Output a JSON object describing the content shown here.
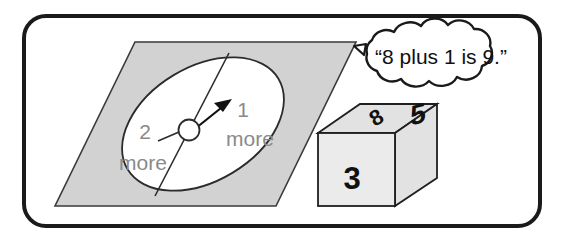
{
  "figure": {
    "frame": {
      "border_color": "#1a1a1a",
      "background": "#ffffff"
    },
    "spinner": {
      "name": "spinner",
      "board_fill": "#d2d2d2",
      "dial_fill": "#ffffff",
      "outline_color": "#2b2b2b",
      "hub_fill": "#ffffff",
      "sectors": [
        {
          "id": "left",
          "line1": "2",
          "line2": "more"
        },
        {
          "id": "right",
          "line1": "1",
          "line2": "more"
        }
      ],
      "pointer": {
        "name": "spinner-arrow",
        "points_to": "1 more",
        "color": "#111111"
      }
    },
    "number_cube": {
      "name": "number-cube",
      "face_fill_front": "#ebebeb",
      "face_fill_top": "#e2e2e2",
      "face_fill_right": "#e2e2e2",
      "outline_color": "#1f1f1f",
      "faces": [
        {
          "id": "top",
          "value": "8"
        },
        {
          "id": "front",
          "value": "3"
        },
        {
          "id": "right",
          "value": "5"
        }
      ]
    },
    "speech_bubble": {
      "name": "speech-bubble",
      "fill": "#ffffff",
      "outline_color": "#1a1a1a",
      "text": "“8 plus 1 is 9.”"
    }
  }
}
